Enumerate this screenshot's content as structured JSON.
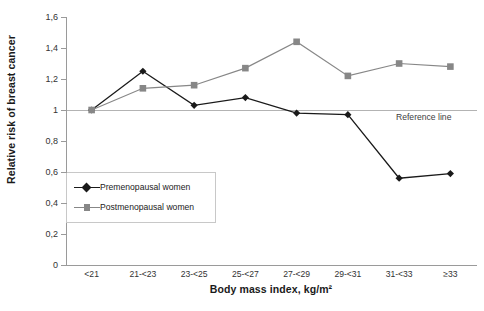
{
  "chart_data": {
    "type": "line",
    "title": "",
    "xlabel": "Body mass index, kg/m²",
    "ylabel": "Relative risk of breast cancer",
    "categories": [
      "<21",
      "21-<23",
      "23-<25",
      "25-<27",
      "27-<29",
      "29-<31",
      "31-<33",
      "≥33"
    ],
    "ylim": [
      0,
      1.6
    ],
    "ytick_labels": [
      "1,6",
      "1,4",
      "1,2",
      "1",
      "0,8",
      "0,6",
      "0,4",
      "0,2",
      "0"
    ],
    "ytick_values": [
      1.6,
      1.4,
      1.2,
      1.0,
      0.8,
      0.6,
      0.4,
      0.2,
      0
    ],
    "grid": false,
    "legend_position": "inside-lower-left",
    "series": [
      {
        "name": "Premenopausal women",
        "marker": "diamond",
        "color": "#1a1a1a",
        "values": [
          1.0,
          1.25,
          1.03,
          1.08,
          0.98,
          0.97,
          0.56,
          0.59
        ]
      },
      {
        "name": "Postmenopausal women",
        "marker": "square",
        "color": "#878787",
        "values": [
          1.0,
          1.14,
          1.16,
          1.27,
          1.44,
          1.22,
          1.3,
          1.28
        ]
      }
    ],
    "annotations": [
      {
        "text": "Reference line",
        "value": 1.0
      }
    ],
    "reference_line": {
      "label": "Reference line",
      "value": 1.0,
      "color": "#b3b3b3"
    }
  }
}
